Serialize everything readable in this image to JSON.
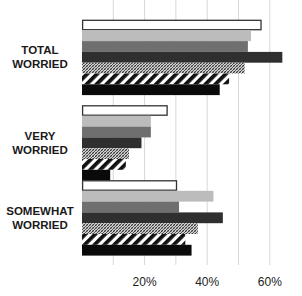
{
  "chart_data": {
    "type": "bar",
    "orientation": "horizontal",
    "title": "",
    "xlabel": "",
    "ylabel": "",
    "categories": [
      "TOTAL WORRIED",
      "VERY WORRIED",
      "SOMEWHAT WORRIED"
    ],
    "category_lines": [
      [
        "TOTAL",
        "WORRIED"
      ],
      [
        "VERY",
        "WORRIED"
      ],
      [
        "SOMEWHAT",
        "WORRIED"
      ]
    ],
    "series": [
      {
        "name": "Series 1",
        "style": "white-outlined",
        "values": [
          57,
          27,
          30
        ]
      },
      {
        "name": "Series 2",
        "style": "light-gray",
        "values": [
          54,
          22,
          42
        ]
      },
      {
        "name": "Series 3",
        "style": "medium-gray",
        "values": [
          53,
          22,
          31
        ]
      },
      {
        "name": "Series 4",
        "style": "dark-gray",
        "values": [
          64,
          19,
          45
        ]
      },
      {
        "name": "Series 5",
        "style": "fine-crosshatch",
        "values": [
          52,
          15,
          37
        ]
      },
      {
        "name": "Series 6",
        "style": "bold-diagonal-stripes",
        "values": [
          47,
          14,
          33
        ]
      },
      {
        "name": "Series 7",
        "style": "black",
        "values": [
          44,
          9,
          35
        ]
      }
    ],
    "xlim": [
      0,
      70
    ],
    "xticks": [
      20,
      40,
      60
    ],
    "xtick_labels": [
      "20%",
      "40%",
      "60%"
    ],
    "gridlines": [
      10,
      20,
      30,
      40,
      50,
      60
    ],
    "grid": true,
    "legend": "none",
    "colors": {
      "white-outlined": "#ffffff",
      "light-gray": "#bcbcbc",
      "medium-gray": "#6f6f6f",
      "dark-gray": "#2f2f2f",
      "fine-crosshatch": "#8a8a8a",
      "bold-diagonal-stripes": "#111111",
      "black": "#0a0a0a",
      "outline": "#333333"
    }
  }
}
